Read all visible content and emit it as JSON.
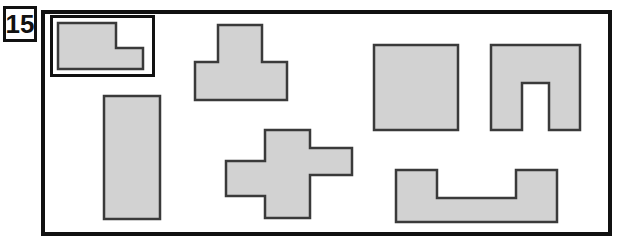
{
  "figure": {
    "problem_number": "15",
    "colors": {
      "shape_fill": "#d2d2d2",
      "shape_stroke": "#3a3a3a",
      "frame_stroke": "#111111",
      "background": "#ffffff",
      "label_text": "#111111"
    },
    "label_box": {
      "name": "problem-number-box",
      "x": 3,
      "y": 6,
      "width": 34,
      "height": 36,
      "border_width": 3
    },
    "outer_frame": {
      "name": "worksheet-frame",
      "x": 41,
      "y": 10,
      "width": 571,
      "height": 226,
      "border_width": 4
    },
    "example_box": {
      "name": "example-frame",
      "x": 50,
      "y": 15,
      "width": 105,
      "height": 62,
      "border_width": 3
    },
    "shapes": [
      {
        "name": "shape-l-example",
        "label": "L-shape (worked example)",
        "kind": "L",
        "points": "58,23 116,23 116,48 143,48 143,69 58,69",
        "inside_example_box": true
      },
      {
        "name": "shape-t-block",
        "label": "T-shape",
        "kind": "T",
        "points": "218,25 262,25 262,62 287,62 287,100 195,100 195,62 218,62",
        "inside_example_box": false
      },
      {
        "name": "shape-tall-rectangle",
        "label": "Tall vertical rectangle",
        "kind": "rectangle",
        "points": "104,96 160,96 160,219 104,219",
        "inside_example_box": false
      },
      {
        "name": "shape-cross",
        "label": "Cross / plus shape with offset arms",
        "kind": "cross",
        "points": "265,130 310,130 310,148 352,148 352,175 310,175 310,218 265,218 265,196 226,196 226,161 265,161",
        "inside_example_box": false
      },
      {
        "name": "shape-square",
        "label": "Square",
        "kind": "square",
        "points": "374,45 458,45 458,130 374,130",
        "inside_example_box": false
      },
      {
        "name": "shape-arch",
        "label": "Inverted U / arch shape",
        "kind": "arch",
        "points": "491,45 580,45 580,130 549,130 549,83 522,83 522,130 491,130",
        "inside_example_box": false
      },
      {
        "name": "shape-u-block",
        "label": "Wide U-shape",
        "kind": "U",
        "points": "396,170 437,170 437,198 516,198 516,170 557,170 557,222 396,222",
        "inside_example_box": false
      }
    ]
  }
}
